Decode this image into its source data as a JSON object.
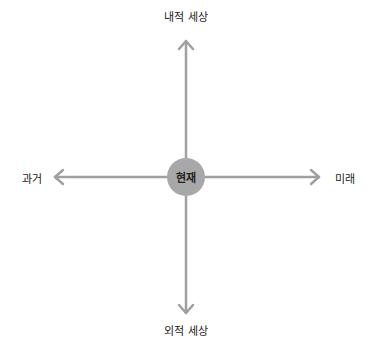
{
  "diagram": {
    "type": "axis-cross",
    "center_label": "현재",
    "axes": {
      "up": "내적 세상",
      "down": "외적 세상",
      "left": "과거",
      "right": "미래"
    },
    "colors": {
      "arrow": "#a0a0a0",
      "center_fill": "#a8a8a8",
      "text": "#222222"
    }
  }
}
